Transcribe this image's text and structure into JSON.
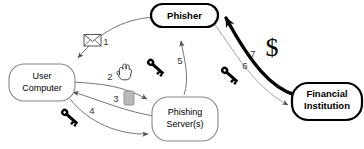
{
  "diagram": {
    "nodes": [
      {
        "id": "phisher",
        "label": "Phisher",
        "emphasis": "bold"
      },
      {
        "id": "user-computer",
        "label_line1": "User",
        "label_line2": "Computer",
        "emphasis": "normal"
      },
      {
        "id": "phishing-server",
        "label_line1": "Phishing",
        "label_line2": "Server(s)",
        "emphasis": "normal"
      },
      {
        "id": "financial-institution",
        "label_line1": "Financial",
        "label_line2": "Institution",
        "emphasis": "bold"
      }
    ],
    "steps": [
      {
        "number": "1",
        "icon": "envelope-icon",
        "from": "phisher",
        "to": "user-computer"
      },
      {
        "number": "2",
        "icon": "hand-cursor-icon",
        "from": "user-computer",
        "to": "phishing-server"
      },
      {
        "number": "3",
        "icon": "document-icon",
        "from": "phishing-server",
        "to": "user-computer"
      },
      {
        "number": "4",
        "icon": "key-icon",
        "from": "user-computer",
        "to": "phishing-server"
      },
      {
        "number": "5",
        "icon": "key-icon",
        "from": "phishing-server",
        "to": "phisher"
      },
      {
        "number": "6",
        "icon": "key-icon",
        "from": "phisher",
        "to": "financial-institution"
      },
      {
        "number": "7",
        "icon": "dollar-icon",
        "from": "financial-institution",
        "to": "phisher"
      }
    ],
    "dollar_symbol": "$",
    "colors": {
      "stroke": "#000000",
      "thin_stroke": "#808080",
      "document_fill": "#b8b8b8",
      "background": "#ffffff"
    }
  }
}
